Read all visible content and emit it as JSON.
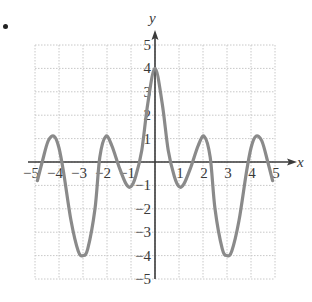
{
  "bullet": "•",
  "chart_data": {
    "type": "line",
    "title": "",
    "xlabel": "x",
    "ylabel": "y",
    "xlim": [
      -5,
      5
    ],
    "ylim": [
      -5,
      5
    ],
    "grid": true,
    "x_ticks": [
      -5,
      -4,
      -3,
      -2,
      -1,
      1,
      2,
      3,
      4,
      5
    ],
    "y_ticks": [
      -5,
      -4,
      -3,
      -2,
      -1,
      1,
      2,
      3,
      4,
      5
    ],
    "x_tick_labels": [
      "−5",
      "−4",
      "−3",
      "−2",
      "−1",
      "1",
      "2",
      "3",
      "4",
      "5"
    ],
    "y_tick_labels": [
      "−5",
      "−4",
      "−3",
      "−2",
      "−1",
      "1",
      "2",
      "3",
      "4",
      "5"
    ],
    "series": [
      {
        "name": "f(x)",
        "color": "#8a8a8a",
        "points": [
          [
            -4.9,
            -0.8
          ],
          [
            -4.7,
            0.0
          ],
          [
            -4.45,
            0.9
          ],
          [
            -4.2,
            1.1
          ],
          [
            -4.0,
            0.6
          ],
          [
            -3.8,
            -0.5
          ],
          [
            -3.5,
            -2.5
          ],
          [
            -3.2,
            -3.8
          ],
          [
            -3.0,
            -4.0
          ],
          [
            -2.8,
            -3.7
          ],
          [
            -2.5,
            -2.0
          ],
          [
            -2.3,
            0.2
          ],
          [
            -2.05,
            1.1
          ],
          [
            -1.8,
            0.7
          ],
          [
            -1.5,
            -0.2
          ],
          [
            -1.2,
            -0.95
          ],
          [
            -1.0,
            -1.05
          ],
          [
            -0.8,
            -0.6
          ],
          [
            -0.55,
            0.5
          ],
          [
            -0.3,
            2.5
          ],
          [
            0.0,
            4.0
          ],
          [
            0.3,
            2.5
          ],
          [
            0.55,
            0.5
          ],
          [
            0.8,
            -0.6
          ],
          [
            1.0,
            -1.05
          ],
          [
            1.2,
            -0.95
          ],
          [
            1.5,
            -0.2
          ],
          [
            1.8,
            0.7
          ],
          [
            2.05,
            1.1
          ],
          [
            2.3,
            0.2
          ],
          [
            2.5,
            -2.0
          ],
          [
            2.8,
            -3.7
          ],
          [
            3.0,
            -4.0
          ],
          [
            3.2,
            -3.8
          ],
          [
            3.5,
            -2.5
          ],
          [
            3.8,
            -0.5
          ],
          [
            4.0,
            0.6
          ],
          [
            4.2,
            1.1
          ],
          [
            4.45,
            0.9
          ],
          [
            4.7,
            0.0
          ],
          [
            4.9,
            -0.8
          ]
        ]
      }
    ],
    "key_points": {
      "max": [
        0,
        4
      ],
      "minima": [
        [
          -3,
          -4
        ],
        [
          3,
          -4
        ],
        [
          -1,
          -1
        ],
        [
          1,
          -1
        ]
      ],
      "local_maxima": [
        [
          -4.2,
          1
        ],
        [
          -2,
          1
        ],
        [
          2,
          1
        ],
        [
          4.2,
          1
        ]
      ]
    },
    "style": {
      "grid_color": "#c8c8c8",
      "axis_color": "#3a3a3a",
      "curve_color": "#8a8a8a",
      "curve_width": 3.2
    }
  }
}
